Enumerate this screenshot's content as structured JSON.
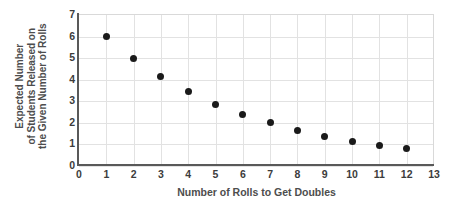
{
  "chart_data": {
    "type": "scatter",
    "title": "",
    "xlabel": "Number of Rolls to Get Doubles",
    "ylabel_lines": [
      "Expected Number",
      "of Students Released on",
      "the Given Number of Rolls"
    ],
    "ylabel": "Expected Number of Students Released on the Given Number of Rolls",
    "x": [
      1,
      2,
      3,
      4,
      5,
      6,
      7,
      8,
      9,
      10,
      11,
      12
    ],
    "values": [
      6,
      5,
      4.15,
      3.45,
      2.85,
      2.4,
      2,
      1.65,
      1.35,
      1.15,
      0.95,
      0.8
    ],
    "xlim": [
      0,
      13
    ],
    "ylim": [
      0,
      7
    ],
    "xticks": [
      0,
      1,
      2,
      3,
      4,
      5,
      6,
      7,
      8,
      9,
      10,
      11,
      12,
      13
    ],
    "yticks": [
      0,
      1,
      2,
      3,
      4,
      5,
      6,
      7
    ],
    "grid": true,
    "legend": null,
    "marker_color": "#1a1a1a",
    "gridline_color": "#e2e2e2",
    "axis_color": "#595959",
    "text_color": "#4d4d4d",
    "background": "#ffffff"
  }
}
